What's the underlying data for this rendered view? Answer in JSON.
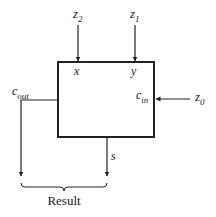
{
  "diagram": {
    "inputs": {
      "z2": {
        "var": "z",
        "sub": "2"
      },
      "z1": {
        "var": "z",
        "sub": "1"
      },
      "z0": {
        "var": "z",
        "sub": "0"
      }
    },
    "ports": {
      "x": "x",
      "y": "y",
      "cin": {
        "var": "c",
        "sub": "in"
      },
      "cout": {
        "var": "c",
        "sub": "out"
      },
      "s": "s"
    },
    "result_label": "Result",
    "colors": {
      "line": "#222222",
      "background": "#ffffff"
    }
  }
}
